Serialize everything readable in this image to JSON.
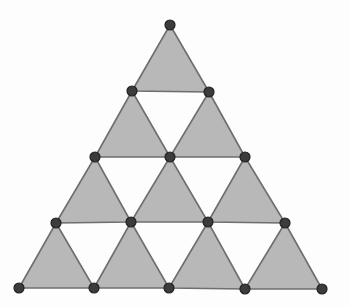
{
  "diagram": {
    "type": "triangular-grid",
    "colors": {
      "background": "#fdfdfd",
      "triangle_fill": "#b8b8b8",
      "triangle_stroke": "#6e6e6e",
      "vertex_fill": "#3c3c3c"
    },
    "vertices": [
      {
        "id": "v0",
        "x": 170,
        "y": 25
      },
      {
        "id": "v1",
        "x": 132,
        "y": 91
      },
      {
        "id": "v2",
        "x": 209,
        "y": 92
      },
      {
        "id": "v3",
        "x": 95,
        "y": 157
      },
      {
        "id": "v4",
        "x": 170,
        "y": 157
      },
      {
        "id": "v5",
        "x": 245,
        "y": 157
      },
      {
        "id": "v6",
        "x": 56,
        "y": 223
      },
      {
        "id": "v7",
        "x": 131,
        "y": 222
      },
      {
        "id": "v8",
        "x": 208,
        "y": 222
      },
      {
        "id": "v9",
        "x": 285,
        "y": 223
      },
      {
        "id": "v10",
        "x": 19,
        "y": 288
      },
      {
        "id": "v11",
        "x": 94,
        "y": 288
      },
      {
        "id": "v12",
        "x": 169,
        "y": 288
      },
      {
        "id": "v13",
        "x": 245,
        "y": 289
      },
      {
        "id": "v14",
        "x": 322,
        "y": 289
      }
    ],
    "shaded_triangles": [
      [
        "v0",
        "v1",
        "v2"
      ],
      [
        "v1",
        "v3",
        "v4"
      ],
      [
        "v2",
        "v4",
        "v5"
      ],
      [
        "v3",
        "v6",
        "v7"
      ],
      [
        "v4",
        "v7",
        "v8"
      ],
      [
        "v5",
        "v8",
        "v9"
      ],
      [
        "v6",
        "v10",
        "v11"
      ],
      [
        "v7",
        "v11",
        "v12"
      ],
      [
        "v8",
        "v12",
        "v13"
      ],
      [
        "v9",
        "v13",
        "v14"
      ]
    ],
    "vertex_count": 15,
    "shaded_triangle_count": 10,
    "rows": 4
  }
}
